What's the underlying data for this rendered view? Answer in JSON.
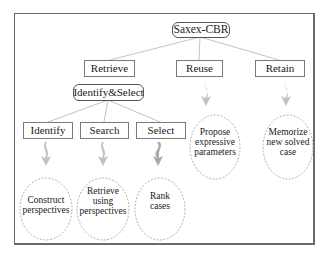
{
  "diagram": {
    "root": {
      "label": "Saxex-CBR"
    },
    "phases": [
      {
        "id": "retrieve",
        "label": "Retrieve"
      },
      {
        "id": "reuse",
        "label": "Reuse"
      },
      {
        "id": "retain",
        "label": "Retain"
      }
    ],
    "subprocess": {
      "label": "Identify&Select"
    },
    "tasks": [
      {
        "id": "identify",
        "label": "Identify"
      },
      {
        "id": "search",
        "label": "Search"
      },
      {
        "id": "select",
        "label": "Select"
      }
    ],
    "methods": [
      {
        "id": "construct",
        "line1": "Construct",
        "line2": "perspectives",
        "line3": ""
      },
      {
        "id": "retrieve-using",
        "line1": "Retrieve",
        "line2": "using",
        "line3": "perspectives"
      },
      {
        "id": "rank",
        "line1": "Rank",
        "line2": "cases",
        "line3": ""
      },
      {
        "id": "propose",
        "line1": "Propose",
        "line2": "expressive",
        "line3": "parameters"
      },
      {
        "id": "memorize",
        "line1": "Memorize",
        "line2": "new solved",
        "line3": "case"
      }
    ],
    "colors": {
      "frame": "#6a6a6a",
      "box_border": "#7a7a7a",
      "connector": "#bdbdbd",
      "arrow": "#b8b8b8",
      "ellipse": "#9a9a9a"
    }
  }
}
